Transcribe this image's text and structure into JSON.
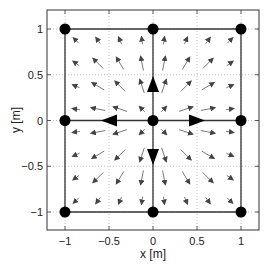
{
  "chart_data": {
    "type": "quiver",
    "title": "",
    "xlabel": "x [m]",
    "ylabel": "y [m]",
    "xlim": [
      -1.2,
      1.2
    ],
    "ylim": [
      -1.2,
      1.2
    ],
    "xticks": [
      -1,
      -0.5,
      0,
      0.5,
      1
    ],
    "yticks": [
      -1,
      -0.5,
      0,
      0.5,
      1
    ],
    "xtick_labels": [
      "−1",
      "−0.5",
      "0",
      "0.5",
      "1"
    ],
    "ytick_labels": [
      "−1",
      "−0.5",
      "0",
      "0.5",
      "1"
    ],
    "grid": "dotted at ticks",
    "nodes": [
      [
        -1,
        1
      ],
      [
        0,
        1
      ],
      [
        1,
        1
      ],
      [
        -1,
        0
      ],
      [
        0,
        0
      ],
      [
        1,
        0
      ],
      [
        -1,
        -1
      ],
      [
        0,
        -1
      ],
      [
        1,
        -1
      ]
    ],
    "edges": [
      [
        [
          -1,
          1
        ],
        [
          1,
          1
        ]
      ],
      [
        [
          -1,
          0
        ],
        [
          1,
          0
        ]
      ],
      [
        [
          -1,
          -1
        ],
        [
          1,
          -1
        ]
      ],
      [
        [
          -1,
          1
        ],
        [
          -1,
          -1
        ]
      ],
      [
        [
          0,
          1
        ],
        [
          0,
          -1
        ]
      ],
      [
        [
          1,
          1
        ],
        [
          1,
          -1
        ]
      ]
    ],
    "direction_arrows": [
      {
        "at": [
          0,
          0.4
        ],
        "dir": "up"
      },
      {
        "at": [
          -0.5,
          0
        ],
        "dir": "left"
      },
      {
        "at": [
          0.5,
          0
        ],
        "dir": "right"
      },
      {
        "at": [
          0,
          -0.4
        ],
        "dir": "down"
      }
    ],
    "vector_field": {
      "description": "radially outward field from origin, magnitude peaks mid-way and vanishes at boundary",
      "grid_x": [
        -0.875,
        -0.625,
        -0.375,
        -0.125,
        0.125,
        0.375,
        0.625,
        0.875
      ],
      "grid_y": [
        -0.875,
        -0.625,
        -0.375,
        -0.125,
        0.125,
        0.375,
        0.625,
        0.875
      ]
    }
  }
}
